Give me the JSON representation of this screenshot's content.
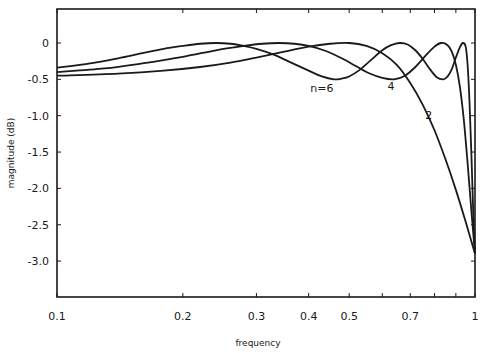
{
  "chart_data": {
    "type": "line",
    "title": "",
    "xlabel": "frequency",
    "ylabel": "magnitude (dB)",
    "xscale": "log",
    "xlim": [
      0.1,
      1
    ],
    "ylim": [
      -3.5,
      0.4
    ],
    "grid": false,
    "legend": "inline curve labels",
    "x_ticks": [
      0.1,
      0.2,
      0.3,
      0.4,
      0.5,
      0.6,
      0.7,
      0.8,
      0.9,
      1
    ],
    "x_tick_labels": [
      {
        "value": 0.1,
        "label": "0.1"
      },
      {
        "value": 0.2,
        "label": "0.2"
      },
      {
        "value": 0.3,
        "label": "0.3"
      },
      {
        "value": 0.4,
        "label": "0.4"
      },
      {
        "value": 0.5,
        "label": "0.5"
      },
      {
        "value": 0.7,
        "label": "0.7"
      },
      {
        "value": 1,
        "label": "1"
      }
    ],
    "y_ticks": [
      {
        "value": 0,
        "label": "0"
      },
      {
        "value": -0.5,
        "label": "-0.5"
      },
      {
        "value": -1.0,
        "label": "-1.0"
      },
      {
        "value": -1.5,
        "label": "-1.5"
      },
      {
        "value": -2.0,
        "label": "-2.0"
      },
      {
        "value": -2.5,
        "label": "-2.5"
      },
      {
        "value": -3.0,
        "label": "-3.0"
      }
    ],
    "series": [
      {
        "name": "n=6",
        "label": "n=6",
        "label_pos": {
          "f": 0.43,
          "db": -0.68
        },
        "x": [
          0.1,
          0.12,
          0.14,
          0.16,
          0.18,
          0.2,
          0.22,
          0.24,
          0.26,
          0.28,
          0.3,
          0.33,
          0.36,
          0.4,
          0.43,
          0.46,
          0.48,
          0.5,
          0.53,
          0.56,
          0.6,
          0.63,
          0.66,
          0.69,
          0.72,
          0.75,
          0.78,
          0.81,
          0.84,
          0.86,
          0.88,
          0.9,
          0.92,
          0.935,
          0.95,
          0.96,
          0.97,
          0.98,
          0.99,
          1.0
        ],
        "values": [
          -0.34,
          -0.28,
          -0.21,
          -0.14,
          -0.08,
          -0.04,
          -0.01,
          0.0,
          -0.01,
          -0.04,
          -0.08,
          -0.16,
          -0.26,
          -0.38,
          -0.46,
          -0.5,
          -0.49,
          -0.46,
          -0.37,
          -0.25,
          -0.1,
          -0.03,
          0.0,
          -0.02,
          -0.1,
          -0.22,
          -0.36,
          -0.47,
          -0.5,
          -0.46,
          -0.36,
          -0.2,
          -0.06,
          0.0,
          -0.05,
          -0.3,
          -0.8,
          -1.5,
          -2.3,
          -2.9
        ]
      },
      {
        "name": "n=4",
        "label": "4",
        "label_pos": {
          "f": 0.63,
          "db": -0.64
        },
        "x": [
          0.1,
          0.13,
          0.16,
          0.2,
          0.24,
          0.28,
          0.31,
          0.34,
          0.37,
          0.4,
          0.44,
          0.48,
          0.52,
          0.56,
          0.6,
          0.64,
          0.68,
          0.72,
          0.76,
          0.8,
          0.83,
          0.86,
          0.88,
          0.9,
          0.92,
          0.94,
          0.96,
          0.98,
          1.0
        ],
        "values": [
          -0.4,
          -0.35,
          -0.28,
          -0.19,
          -0.1,
          -0.04,
          -0.01,
          0.0,
          -0.01,
          -0.04,
          -0.11,
          -0.21,
          -0.32,
          -0.42,
          -0.48,
          -0.5,
          -0.45,
          -0.33,
          -0.18,
          -0.05,
          0.0,
          -0.03,
          -0.12,
          -0.3,
          -0.6,
          -1.05,
          -1.65,
          -2.3,
          -2.9
        ]
      },
      {
        "name": "n=2",
        "label": "2",
        "label_pos": {
          "f": 0.775,
          "db": -1.05
        },
        "x": [
          0.1,
          0.14,
          0.18,
          0.22,
          0.26,
          0.3,
          0.35,
          0.4,
          0.45,
          0.5,
          0.55,
          0.6,
          0.65,
          0.7,
          0.75,
          0.8,
          0.85,
          0.9,
          0.95,
          1.0
        ],
        "values": [
          -0.45,
          -0.42,
          -0.38,
          -0.33,
          -0.27,
          -0.2,
          -0.12,
          -0.05,
          -0.01,
          0.0,
          -0.04,
          -0.14,
          -0.3,
          -0.55,
          -0.85,
          -1.2,
          -1.6,
          -2.02,
          -2.46,
          -2.9
        ]
      }
    ]
  }
}
